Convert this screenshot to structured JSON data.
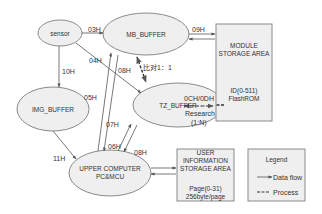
{
  "colors": {
    "node_fill": "#efefef",
    "node_stroke": "#8a8a8a",
    "line": "#555555",
    "text": "#333333",
    "background": "#ffffff"
  },
  "nodes": {
    "sensor": {
      "label": "sensor"
    },
    "mb_buffer": {
      "label": "MB_BUFFER"
    },
    "img_buffer": {
      "label": "IMG_BUFFER"
    },
    "tz_buffer": {
      "label": "TZ_BUFFER"
    },
    "upper_computer": {
      "line1": "UPPER COMPUTER",
      "line2": "PC&MCU"
    }
  },
  "boxes": {
    "module_storage": {
      "title1": "MODULE",
      "title2": "STORAGE AREA",
      "detail1": "ID(0-511)",
      "detail2": "FlashROM"
    },
    "user_storage": {
      "title1": "USER",
      "title2": "INFORMATION",
      "title3": "STORAGE AREA",
      "detail1": "Page(0-31)",
      "detail2": "256byte/page"
    }
  },
  "edges": {
    "sensor_mb": "03H",
    "sensor_tz": "04H",
    "sensor_img": "10H",
    "mb_module": "09H",
    "mb_tz_compare": "比对1：1",
    "upper_mb_05": "05H",
    "mb_upper_08": "08H",
    "upper_tz_07": "07H",
    "upper_tz_06": "06H",
    "tz_upper_08": "08H",
    "img_upper": "11H",
    "tz_module_code": "0CH/0DH",
    "tz_module_research": "Research",
    "tz_module_ratio": "(1:N)"
  },
  "legend": {
    "title": "Legend",
    "data_flow": "Data flow",
    "process": "Process"
  }
}
